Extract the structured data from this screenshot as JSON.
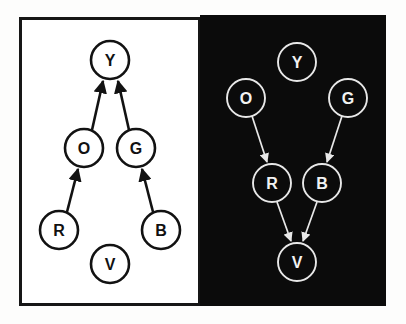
{
  "figure": {
    "title": "",
    "background_color": "#fdfdfc",
    "panels": [
      {
        "id": "light-panel",
        "name": "left-panel",
        "theme": "light",
        "background_color": "#ffffff",
        "border_color": "#161616",
        "node_stroke": "#121212",
        "label_color": "#111111",
        "edge_direction": "upward",
        "nodes": [
          {
            "id": "Y",
            "label": "Y",
            "cx": 110,
            "cy": 60,
            "r": 19
          },
          {
            "id": "O",
            "label": "O",
            "cx": 84,
            "cy": 148,
            "r": 19
          },
          {
            "id": "G",
            "label": "G",
            "cx": 136,
            "cy": 148,
            "r": 19
          },
          {
            "id": "R",
            "label": "R",
            "cx": 59,
            "cy": 230,
            "r": 19
          },
          {
            "id": "B",
            "label": "B",
            "cx": 161,
            "cy": 230,
            "r": 19
          },
          {
            "id": "V",
            "label": "V",
            "cx": 110,
            "cy": 264,
            "r": 19
          }
        ],
        "edges": [
          {
            "from": "O",
            "to": "Y",
            "x1": 92,
            "y1": 130,
            "x2": 103,
            "y2": 81
          },
          {
            "from": "G",
            "to": "Y",
            "x1": 129,
            "y1": 130,
            "x2": 118,
            "y2": 81
          },
          {
            "from": "R",
            "to": "O",
            "x1": 67,
            "y1": 212,
            "x2": 78,
            "y2": 169
          },
          {
            "from": "B",
            "to": "G",
            "x1": 153,
            "y1": 212,
            "x2": 142,
            "y2": 169
          }
        ],
        "isolated_nodes": [
          "V"
        ]
      },
      {
        "id": "dark-panel",
        "name": "right-panel",
        "theme": "dark",
        "background_color": "#0b0b0b",
        "border_color": "#0b0b0b",
        "node_stroke": "#e8e8e8",
        "label_color": "#f2f2f2",
        "edge_direction": "downward",
        "nodes": [
          {
            "id": "Y",
            "label": "Y",
            "cx": 297,
            "cy": 62,
            "r": 19
          },
          {
            "id": "O",
            "label": "O",
            "cx": 246,
            "cy": 98,
            "r": 19
          },
          {
            "id": "G",
            "label": "G",
            "cx": 348,
            "cy": 98,
            "r": 19
          },
          {
            "id": "R",
            "label": "R",
            "cx": 272,
            "cy": 183,
            "r": 19
          },
          {
            "id": "B",
            "label": "B",
            "cx": 322,
            "cy": 183,
            "r": 19
          },
          {
            "id": "V",
            "label": "V",
            "cx": 297,
            "cy": 262,
            "r": 19
          }
        ],
        "edges": [
          {
            "from": "O",
            "to": "R",
            "x1": 252,
            "y1": 116,
            "x2": 267,
            "y2": 162
          },
          {
            "from": "G",
            "to": "B",
            "x1": 342,
            "y1": 116,
            "x2": 327,
            "y2": 162
          },
          {
            "from": "R",
            "to": "V",
            "x1": 277,
            "y1": 202,
            "x2": 291,
            "y2": 241
          },
          {
            "from": "B",
            "to": "V",
            "x1": 317,
            "y1": 202,
            "x2": 303,
            "y2": 241
          }
        ],
        "isolated_nodes": [
          "Y"
        ]
      }
    ]
  }
}
